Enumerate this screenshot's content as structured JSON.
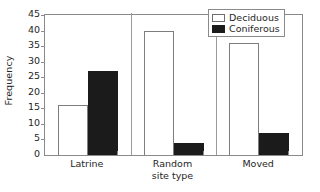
{
  "chart_data": {
    "type": "bar",
    "title": "",
    "subtitle": "",
    "xlabel": "site type",
    "ylabel": "Frequency",
    "categories": [
      "Latrine",
      "Random",
      "Moved"
    ],
    "series": [
      {
        "name": "Deciduous",
        "values": [
          16,
          40,
          36
        ],
        "color": "#ffffff",
        "edge_color": "#7d7d7d"
      },
      {
        "name": "Coniferous",
        "values": [
          27,
          4,
          7
        ],
        "color": "#1b1b1b",
        "edge_color": "#1b1b1b"
      }
    ],
    "ylim": [
      0,
      45
    ],
    "ytick_labels": [
      "0",
      "5",
      "10",
      "15",
      "20",
      "25",
      "30",
      "35",
      "40",
      "45"
    ],
    "ytick_values": [
      0,
      5,
      10,
      15,
      20,
      25,
      30,
      35,
      40,
      45
    ],
    "grid": false,
    "legend_position": "top-right",
    "legend_entries": [
      "Deciduous",
      "Coniferous"
    ],
    "frame": "full-box",
    "annotations": []
  },
  "axes": {
    "y_title": "Frequency",
    "x_title": "site type"
  },
  "legend": {
    "items": [
      {
        "label": "Deciduous",
        "swatch": "legend-swatch-deciduous"
      },
      {
        "label": "Coniferous",
        "swatch": "legend-swatch-coniferous"
      }
    ]
  }
}
